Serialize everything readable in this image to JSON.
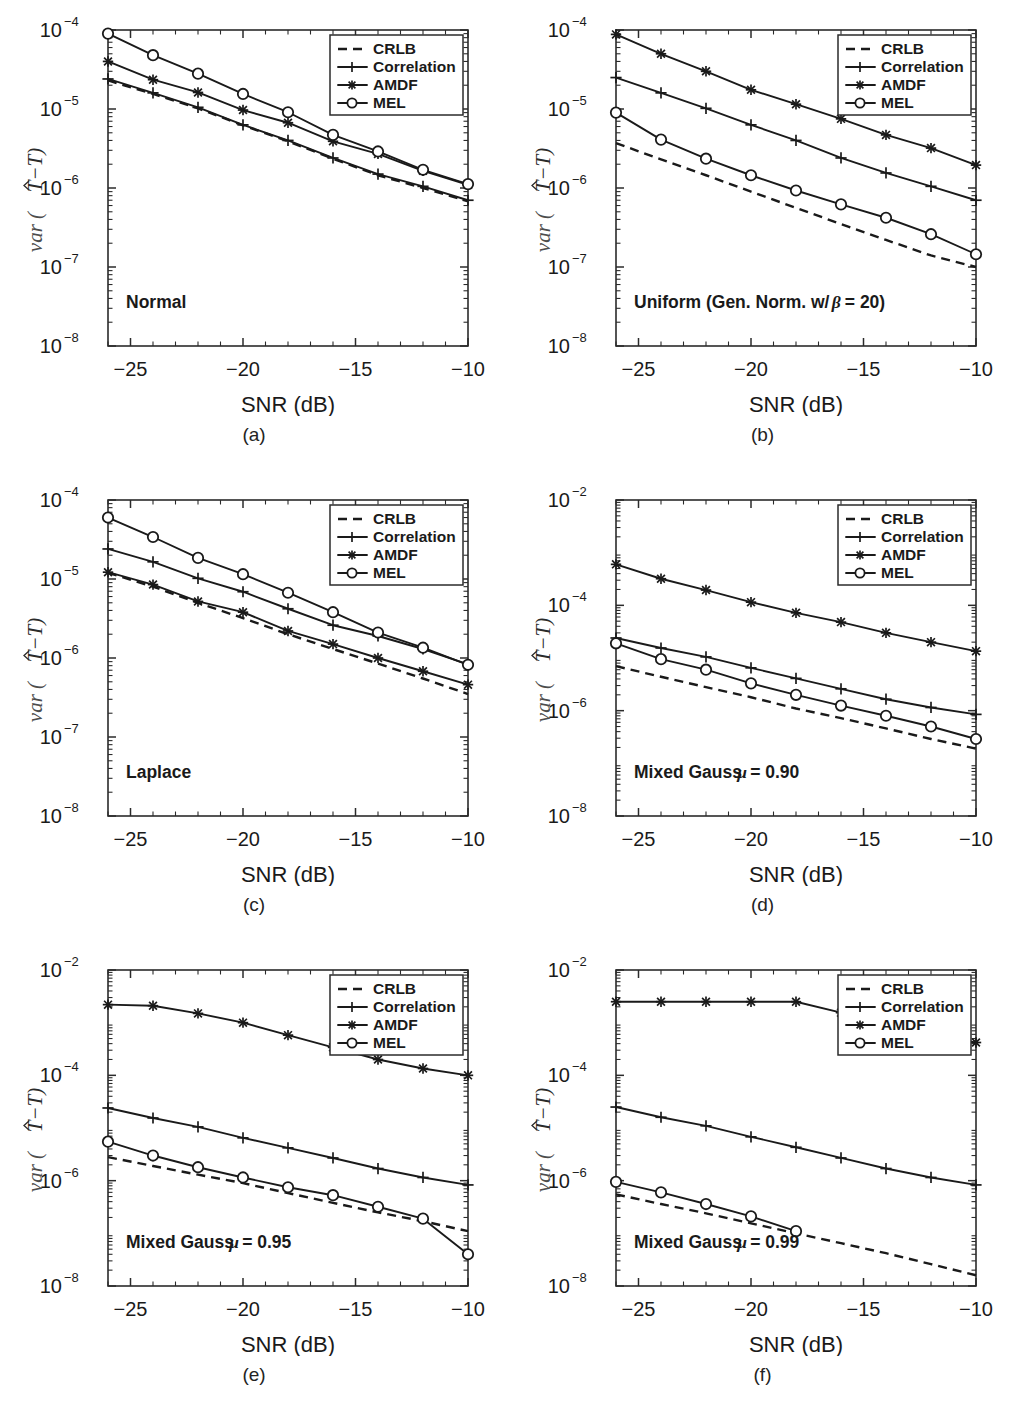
{
  "figure": {
    "xlabel": "SNR (dB)",
    "ylabel_parts": {
      "var": "var",
      "open": "(",
      "tau_hat": "T",
      "minus": "−",
      "tau": "T",
      "close": ")"
    },
    "xticks": [
      "-25",
      "-20",
      "-15",
      "-10"
    ],
    "xtick_values": [
      -25,
      -20,
      -15,
      -10
    ],
    "xlim": [
      -26,
      -10
    ],
    "captions": [
      "(a)",
      "(b)",
      "(c)",
      "(d)",
      "(e)",
      "(f)"
    ],
    "legend": {
      "position": "top-right",
      "entries": [
        {
          "label": "CRLB",
          "marker": "none",
          "style": "dashed"
        },
        {
          "label": "Correlation",
          "marker": "plus",
          "style": "solid"
        },
        {
          "label": "AMDF",
          "marker": "star",
          "style": "solid"
        },
        {
          "label": "MEL",
          "marker": "circle",
          "style": "solid"
        }
      ]
    }
  },
  "chart_data": [
    {
      "type": "line",
      "panel": "a",
      "caption": "(a)",
      "title": "",
      "annotation": "Normal",
      "annotation_italic": "",
      "xlabel": "SNR (dB)",
      "ylabel": "var (T̂−T)",
      "xlim": [
        -26,
        -10
      ],
      "ylim": [
        1e-08,
        0.0001
      ],
      "yticks": [
        1e-08,
        1e-07,
        1e-06,
        1e-05,
        0.0001
      ],
      "ytick_labels": [
        "10-8",
        "10-7",
        "10-6",
        "10-5",
        "10-4"
      ],
      "yscale": "log",
      "grid": false,
      "x": [
        -26,
        -24,
        -22,
        -20,
        -18,
        -16,
        -14,
        -12,
        -10
      ],
      "series": [
        {
          "name": "CRLB",
          "values": [
            2.3e-05,
            1.55e-05,
            1.02e-05,
            6.2e-06,
            3.9e-06,
            2.35e-06,
            1.45e-06,
            1e-06,
            6.8e-07
          ]
        },
        {
          "name": "Correlation",
          "values": [
            2.4e-05,
            1.6e-05,
            1.05e-05,
            6.3e-06,
            4e-06,
            2.4e-06,
            1.5e-06,
            1.05e-06,
            7e-07
          ]
        },
        {
          "name": "AMDF",
          "values": [
            4e-05,
            2.35e-05,
            1.62e-05,
            9.7e-06,
            6.7e-06,
            3.9e-06,
            2.7e-06,
            1.65e-06,
            1.1e-06
          ]
        },
        {
          "name": "MEL",
          "values": [
            9e-05,
            4.8e-05,
            2.8e-05,
            1.55e-05,
            9.1e-06,
            4.7e-06,
            2.9e-06,
            1.7e-06,
            1.12e-06
          ]
        }
      ]
    },
    {
      "type": "line",
      "panel": "b",
      "caption": "(b)",
      "title": "",
      "annotation": "Uniform (Gen. Norm. w/ ",
      "annotation_italic": "β",
      "annotation_tail": " = 20)",
      "xlabel": "SNR (dB)",
      "ylabel": "var (T̂−T)",
      "xlim": [
        -26,
        -10
      ],
      "ylim": [
        1e-08,
        0.0001
      ],
      "yticks": [
        1e-08,
        1e-07,
        1e-06,
        1e-05,
        0.0001
      ],
      "ytick_labels": [
        "10-8",
        "10-7",
        "10-6",
        "10-5",
        "10-4"
      ],
      "yscale": "log",
      "grid": false,
      "x": [
        -26,
        -24,
        -22,
        -20,
        -18,
        -16,
        -14,
        -12,
        -10
      ],
      "series": [
        {
          "name": "CRLB",
          "values": [
            3.7e-06,
            2.3e-06,
            1.45e-06,
            9e-07,
            5.6e-07,
            3.5e-07,
            2.2e-07,
            1.4e-07,
            1e-07
          ]
        },
        {
          "name": "Correlation",
          "values": [
            2.5e-05,
            1.6e-05,
            1.02e-05,
            6.3e-06,
            4e-06,
            2.4e-06,
            1.55e-06,
            1.05e-06,
            7e-07
          ]
        },
        {
          "name": "AMDF",
          "values": [
            8.8e-05,
            5e-05,
            3e-05,
            1.75e-05,
            1.15e-05,
            7.5e-06,
            4.7e-06,
            3.2e-06,
            1.95e-06
          ]
        },
        {
          "name": "MEL",
          "values": [
            9e-06,
            4.1e-06,
            2.35e-06,
            1.45e-06,
            9.3e-07,
            6.2e-07,
            4.2e-07,
            2.6e-07,
            1.45e-07
          ]
        }
      ]
    },
    {
      "type": "line",
      "panel": "c",
      "caption": "(c)",
      "title": "",
      "annotation": "Laplace",
      "annotation_italic": "",
      "xlabel": "SNR (dB)",
      "ylabel": "var (T̂−T)",
      "xlim": [
        -26,
        -10
      ],
      "ylim": [
        1e-08,
        0.0001
      ],
      "yticks": [
        1e-08,
        1e-07,
        1e-06,
        1e-05,
        0.0001
      ],
      "ytick_labels": [
        "10-8",
        "10-7",
        "10-6",
        "10-5",
        "10-4"
      ],
      "yscale": "log",
      "grid": false,
      "x": [
        -26,
        -24,
        -22,
        -20,
        -18,
        -16,
        -14,
        -12,
        -10
      ],
      "series": [
        {
          "name": "CRLB",
          "values": [
            1.2e-05,
            8e-06,
            5e-06,
            3.2e-06,
            2e-06,
            1.3e-06,
            8.5e-07,
            5.5e-07,
            3.5e-07
          ]
        },
        {
          "name": "Correlation",
          "values": [
            2.4e-05,
            1.65e-05,
            1.02e-05,
            6.9e-06,
            4.2e-06,
            2.6e-06,
            1.9e-06,
            1.3e-06,
            8.3e-07
          ]
        },
        {
          "name": "AMDF",
          "values": [
            1.22e-05,
            8.5e-06,
            5.2e-06,
            3.8e-06,
            2.2e-06,
            1.5e-06,
            1e-06,
            6.8e-07,
            4.6e-07
          ]
        },
        {
          "name": "MEL",
          "values": [
            6e-05,
            3.4e-05,
            1.85e-05,
            1.15e-05,
            6.7e-06,
            3.8e-06,
            2.1e-06,
            1.35e-06,
            8.2e-07
          ]
        }
      ]
    },
    {
      "type": "line",
      "panel": "d",
      "caption": "(d)",
      "title": "",
      "annotation": "Mixed Gauss ",
      "annotation_italic": "μ",
      "annotation_tail": " = 0.90",
      "xlabel": "SNR (dB)",
      "ylabel": "var (T̂−T)",
      "xlim": [
        -26,
        -10
      ],
      "ylim": [
        1e-08,
        0.01
      ],
      "yticks": [
        1e-08,
        1e-06,
        0.0001,
        0.01
      ],
      "ytick_labels": [
        "10-8",
        "10-6",
        "10-4",
        "10-2"
      ],
      "yscale": "log",
      "grid": false,
      "x": [
        -26,
        -24,
        -22,
        -20,
        -18,
        -16,
        -14,
        -12,
        -10
      ],
      "series": [
        {
          "name": "CRLB",
          "values": [
            7e-06,
            4.4e-06,
            2.8e-06,
            1.8e-06,
            1.1e-06,
            7.2e-07,
            4.6e-07,
            2.9e-07,
            1.9e-07
          ]
        },
        {
          "name": "Correlation",
          "values": [
            2.4e-05,
            1.55e-05,
            1.05e-05,
            6.5e-06,
            4.1e-06,
            2.6e-06,
            1.65e-06,
            1.15e-06,
            8.5e-07
          ]
        },
        {
          "name": "AMDF",
          "values": [
            0.0006,
            0.00032,
            0.000195,
            0.000115,
            7.2e-05,
            4.8e-05,
            3e-05,
            2e-05,
            1.35e-05
          ]
        },
        {
          "name": "MEL",
          "values": [
            1.9e-05,
            9.5e-06,
            6e-06,
            3.3e-06,
            2e-06,
            1.25e-06,
            8e-07,
            5e-07,
            2.9e-07
          ]
        }
      ]
    },
    {
      "type": "line",
      "panel": "e",
      "caption": "(e)",
      "title": "",
      "annotation": "Mixed Gauss ",
      "annotation_italic": "μ",
      "annotation_tail": " = 0.95",
      "xlabel": "SNR (dB)",
      "ylabel": "var (T̂−T)",
      "xlim": [
        -26,
        -10
      ],
      "ylim": [
        1e-08,
        0.01
      ],
      "yticks": [
        1e-08,
        1e-06,
        0.0001,
        0.01
      ],
      "ytick_labels": [
        "10-8",
        "10-6",
        "10-4",
        "10-2"
      ],
      "yscale": "log",
      "grid": false,
      "x": [
        -26,
        -24,
        -22,
        -20,
        -18,
        -16,
        -14,
        -12,
        -10
      ],
      "series": [
        {
          "name": "CRLB",
          "values": [
            2.8e-06,
            1.9e-06,
            1.3e-06,
            9e-07,
            5.8e-07,
            3.8e-07,
            2.5e-07,
            1.7e-07,
            1.1e-07
          ]
        },
        {
          "name": "Correlation",
          "values": [
            2.4e-05,
            1.55e-05,
            1.05e-05,
            6.5e-06,
            4.2e-06,
            2.7e-06,
            1.7e-06,
            1.15e-06,
            8.3e-07
          ]
        },
        {
          "name": "AMDF",
          "values": [
            0.0022,
            0.0021,
            0.0015,
            0.001,
            0.00058,
            0.00034,
            0.0002,
            0.000135,
            0.0001
          ]
        },
        {
          "name": "MEL",
          "values": [
            5.5e-06,
            3e-06,
            1.8e-06,
            1.15e-06,
            7.5e-07,
            5.3e-07,
            3.2e-07,
            1.9e-07,
            4e-08
          ]
        }
      ]
    },
    {
      "type": "line",
      "panel": "f",
      "caption": "(f)",
      "title": "",
      "annotation": "Mixed Gauss ",
      "annotation_italic": "μ",
      "annotation_tail": " = 0.99",
      "xlabel": "SNR (dB)",
      "ylabel": "var (T̂−T)",
      "xlim": [
        -26,
        -10
      ],
      "ylim": [
        1e-08,
        0.01
      ],
      "yticks": [
        1e-08,
        1e-06,
        0.0001,
        0.01
      ],
      "ytick_labels": [
        "10-8",
        "10-6",
        "10-4",
        "10-2"
      ],
      "yscale": "log",
      "grid": false,
      "x": [
        -26,
        -24,
        -22,
        -20,
        -18,
        -16,
        -14,
        -12,
        -10
      ],
      "series": [
        {
          "name": "CRLB",
          "values": [
            5.5e-07,
            3.6e-07,
            2.4e-07,
            1.55e-07,
            1e-07,
            6.5e-08,
            4.2e-08,
            2.6e-08,
            1.6e-08
          ]
        },
        {
          "name": "Correlation",
          "values": [
            2.5e-05,
            1.6e-05,
            1.1e-05,
            6.8e-06,
            4.3e-06,
            2.7e-06,
            1.7e-06,
            1.15e-06,
            8.3e-07
          ]
        },
        {
          "name": "AMDF",
          "values": [
            0.0025,
            0.0025,
            0.0025,
            0.0025,
            0.0025,
            0.00155,
            0.0009,
            0.00055,
            0.00042
          ]
        },
        {
          "name": "MEL",
          "values": [
            9.5e-07,
            6e-07,
            3.6e-07,
            2.1e-07,
            1.1e-07,
            null,
            null,
            null,
            null
          ]
        }
      ]
    }
  ]
}
